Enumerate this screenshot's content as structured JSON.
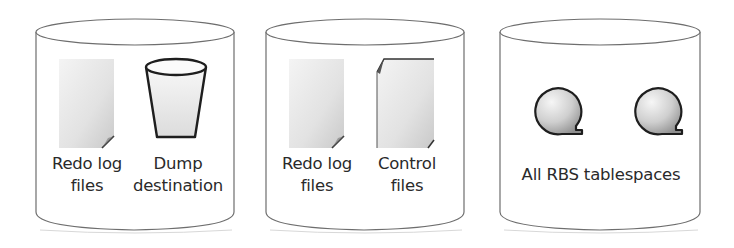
{
  "diagram": {
    "type": "disk-layout",
    "disks": [
      {
        "id": "disk-1",
        "items": [
          {
            "icon": "document-icon",
            "label_lines": [
              "Redo log",
              "files"
            ]
          },
          {
            "icon": "bucket-icon",
            "label_lines": [
              "Dump",
              "destination"
            ]
          }
        ]
      },
      {
        "id": "disk-2",
        "items": [
          {
            "icon": "document-icon",
            "label_lines": [
              "Redo log",
              "files"
            ]
          },
          {
            "icon": "document-icon",
            "label_lines": [
              "Control",
              "files"
            ]
          }
        ]
      },
      {
        "id": "disk-3",
        "items": [
          {
            "icon": "rollback-segment-icon"
          },
          {
            "icon": "rollback-segment-icon"
          }
        ],
        "label": "All RBS tablespaces"
      }
    ]
  },
  "colors": {
    "outline": "#6e6e6e",
    "icon_outline": "#1e1e1e",
    "fill_light": "#f2f2f2",
    "fill_dark": "#9a9a9a",
    "text": "#2a2a2a"
  }
}
